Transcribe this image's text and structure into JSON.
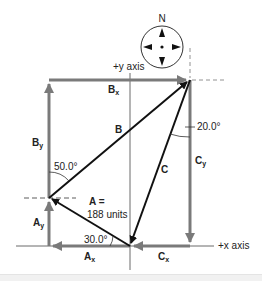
{
  "diagram": {
    "type": "vector-addition",
    "compass": {
      "label": "N"
    },
    "axes": {
      "y_label": "+y axis",
      "x_label": "+x axis"
    },
    "vectors": {
      "A": {
        "label": "A",
        "magnitude_label": "A =",
        "magnitude_value": "188 units",
        "angle": "30.0°"
      },
      "B": {
        "label": "B",
        "angle": "50.0°"
      },
      "C": {
        "label": "C",
        "angle": "20.0°"
      }
    },
    "components": {
      "Ax": {
        "main": "A",
        "sub": "x"
      },
      "Ay": {
        "main": "A",
        "sub": "y"
      },
      "Bx": {
        "main": "B",
        "sub": "x"
      },
      "By": {
        "main": "B",
        "sub": "y"
      },
      "Cx": {
        "main": "C",
        "sub": "x"
      },
      "Cy": {
        "main": "C",
        "sub": "y"
      }
    },
    "colors": {
      "vector": "#111111",
      "component": "#7a7a7a",
      "axis": "#444444"
    }
  }
}
